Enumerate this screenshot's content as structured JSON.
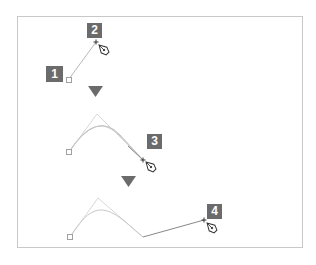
{
  "diagram": {
    "type": "pen-tool-path-steps",
    "colors": {
      "frame_border": "#c8c8c8",
      "label_bg": "#6b6b6b",
      "label_text": "#ffffff",
      "path_light": "#d0d0d0",
      "path_dark": "#888888",
      "arrow": "#6b6b6b"
    },
    "steps": [
      {
        "label": "1"
      },
      {
        "label": "2"
      },
      {
        "label": "3"
      },
      {
        "label": "4"
      }
    ],
    "icons": [
      "anchor-point-icon",
      "pen-tool-icon",
      "down-arrow-icon"
    ]
  }
}
